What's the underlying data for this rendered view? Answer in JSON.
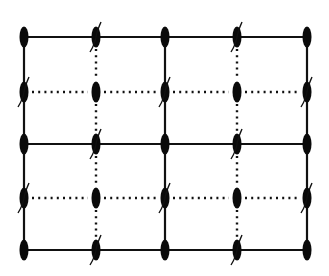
{
  "diagram": {
    "type": "lattice-grid",
    "columns_x": [
      24,
      96,
      165,
      237,
      307
    ],
    "rows_y": [
      37,
      92,
      144,
      198,
      250
    ],
    "node_shape": "vertical-ellipse",
    "node_rx": 4.5,
    "node_ry": 10.5,
    "colors": {
      "line": "#111111",
      "node": "#0a0a0a",
      "background": "#ffffff"
    },
    "solid_rows": [
      0,
      2,
      4
    ],
    "dotted_rows": [
      1,
      3
    ],
    "solid_cols": [
      0,
      2,
      4
    ],
    "dotted_cols": [
      1,
      3
    ],
    "slashed_nodes_rule": "nodes where row index + column index is odd",
    "slash_icon": "curved-slash-mark"
  }
}
